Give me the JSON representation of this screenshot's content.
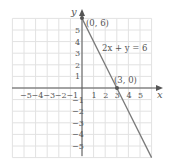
{
  "chart_data": {
    "type": "line",
    "title": "",
    "xlabel": "x",
    "ylabel": "y",
    "xlim": [
      -6,
      6
    ],
    "ylim": [
      -6,
      6
    ],
    "grid": true,
    "x_ticks": [
      "-5",
      "-4",
      "-3",
      "-2",
      "-1",
      "1",
      "2",
      "3",
      "4",
      "5"
    ],
    "y_ticks": [
      "5",
      "4",
      "3",
      "2",
      "1",
      "-1",
      "-2",
      "-3",
      "-4",
      "-5"
    ],
    "series": [
      {
        "name": "2x + y = 6",
        "x": [
          0,
          3,
          6
        ],
        "y": [
          6,
          0,
          -6
        ]
      }
    ],
    "annotations": [
      {
        "label": "(0, 6)",
        "x": 0,
        "y": 6
      },
      {
        "label": "(3, 0)",
        "x": 3,
        "y": 0
      },
      {
        "label": "2x + y = 6",
        "x": 2.2,
        "y": 4
      }
    ],
    "colors": {
      "line": "#7a7a7a",
      "grid": "#e0e0e0",
      "axis": "#555555"
    }
  }
}
